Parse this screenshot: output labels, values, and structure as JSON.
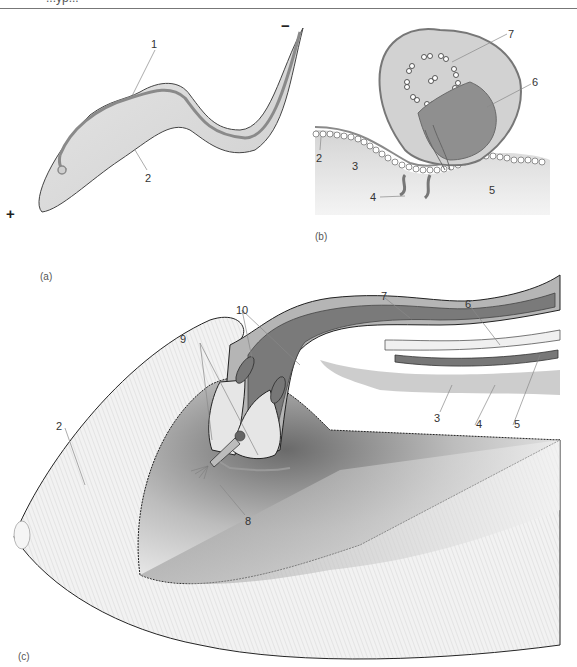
{
  "header": {
    "running_title": "...yp..."
  },
  "panels": {
    "a": {
      "label": "(a)",
      "polarity_plus": "+",
      "polarity_minus": "−",
      "callouts": [
        "1",
        "2"
      ]
    },
    "b": {
      "label": "(b)",
      "callouts": [
        "2",
        "3",
        "4",
        "5",
        "6",
        "7"
      ]
    },
    "c": {
      "label": "(c)",
      "callouts": [
        "2",
        "3",
        "4",
        "5",
        "6",
        "7",
        "8",
        "9",
        "10"
      ]
    }
  },
  "colors": {
    "membrane": "#8a8a8a",
    "body_fill": "#d9d9d9",
    "dark_tube": "#7a7a7a",
    "light_tube": "#f0f0f0",
    "background_gray": "#cfcfcf",
    "outline": "#222222"
  }
}
